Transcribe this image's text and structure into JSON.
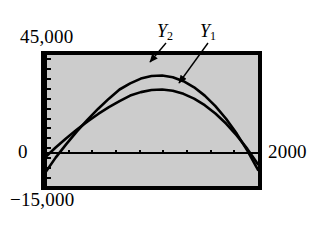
{
  "figure": {
    "kind": "graphing-calculator-screen",
    "background_color": "#cccccc",
    "frame_color": "#000000",
    "curve_color": "#000000"
  },
  "labels": {
    "y_max": "45,000",
    "y_zero": "0",
    "y_min": "−15,000",
    "x_max": "2000",
    "series_y2": "Y",
    "series_y2_sub": "2",
    "series_y1": "Y",
    "series_y1_sub": "1"
  },
  "chart_data": {
    "type": "line",
    "title": "",
    "xlabel": "",
    "ylabel": "",
    "xlim": [
      0,
      2000
    ],
    "ylim": [
      -15000,
      45000
    ],
    "grid": false,
    "legend_position": "above-plot-inline-annotations",
    "axis_ticks": {
      "x_axis_drawn_at_y": 0,
      "y_axis_drawn_at_x": 0,
      "x_tick_count": 8,
      "y_tick_count": 12
    },
    "annotations": [
      {
        "text": "Y2",
        "points_to_series": "Y2",
        "arrow": true
      },
      {
        "text": "Y1",
        "points_to_series": "Y1",
        "arrow": true
      }
    ],
    "series": [
      {
        "name": "Y2",
        "x": [
          0,
          100,
          200,
          300,
          400,
          500,
          600,
          700,
          800,
          900,
          1000,
          1100,
          1200,
          1300,
          1400,
          1500,
          1600,
          1700,
          1800,
          1900,
          2000
        ],
        "values": [
          -9000,
          -2000,
          4200,
          10000,
          15400,
          20400,
          25000,
          29200,
          32000,
          34200,
          35400,
          35600,
          34800,
          33000,
          30200,
          26400,
          21600,
          15800,
          9000,
          1200,
          -7600
        ]
      },
      {
        "name": "Y1",
        "x": [
          0,
          100,
          200,
          300,
          400,
          500,
          600,
          700,
          800,
          900,
          1000,
          1100,
          1200,
          1300,
          1400,
          1500,
          1600,
          1700,
          1800,
          1900,
          2000
        ],
        "values": [
          -2000,
          2600,
          6900,
          10900,
          14600,
          18000,
          21100,
          23900,
          26400,
          28000,
          29000,
          29200,
          28600,
          27200,
          25000,
          22000,
          18200,
          13600,
          8200,
          2000,
          -5000
        ]
      }
    ]
  }
}
